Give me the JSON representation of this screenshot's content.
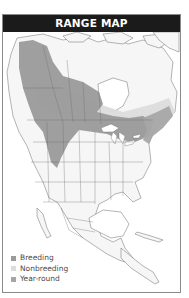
{
  "header": {
    "title": "RANGE MAP"
  },
  "legend": {
    "items": [
      {
        "label": "Breeding",
        "color": "#9a9a9a"
      },
      {
        "label": "Nonbreeding",
        "color": "#dcdcdc"
      },
      {
        "label": "Year-round",
        "color": "#a6a6a6"
      }
    ]
  },
  "colors": {
    "header_bg": "#1b1b1b",
    "land": "#f7f7f7",
    "breeding": "#9a9a9a",
    "nonbreeding": "#dcdcdc",
    "border": "#8a8a8a"
  }
}
